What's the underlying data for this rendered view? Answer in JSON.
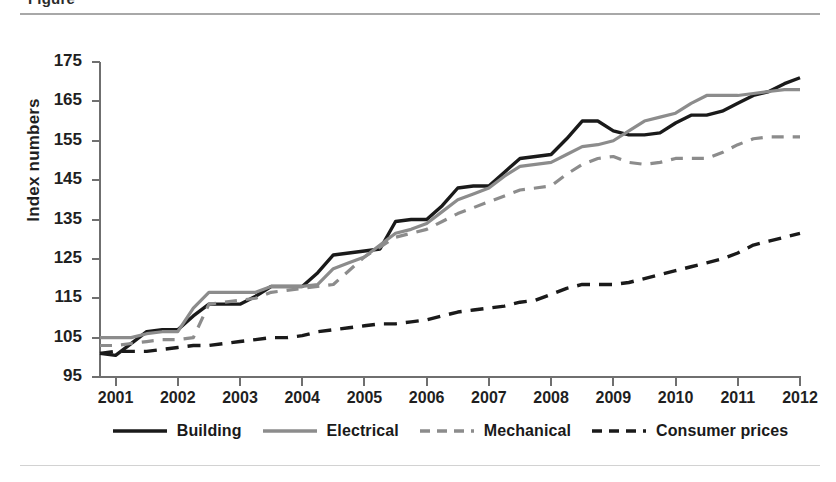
{
  "page": {
    "clipped_heading_fragment": "Figure",
    "divider_color": "#a8a8a8"
  },
  "axes": {
    "ylabel": "Index numbers",
    "yticks": [
      95,
      105,
      115,
      125,
      135,
      145,
      155,
      165,
      175
    ],
    "xticks": [
      "2001",
      "2002",
      "2003",
      "2004",
      "2005",
      "2006",
      "2007",
      "2008",
      "2009",
      "2010",
      "2011",
      "2012"
    ]
  },
  "legend": {
    "items": [
      {
        "label": "Building",
        "color": "#1a1a1a",
        "dash": "none"
      },
      {
        "label": "Electrical",
        "color": "#8c8c8c",
        "dash": "none"
      },
      {
        "label": "Mechanical",
        "color": "#8c8c8c",
        "dash": "dashed"
      },
      {
        "label": "Consumer prices",
        "color": "#1a1a1a",
        "dash": "dashed"
      }
    ]
  },
  "chart_data": {
    "type": "line",
    "title": "",
    "xlabel": "",
    "ylabel": "Index numbers",
    "xlim": [
      2000.75,
      2012.0
    ],
    "ylim": [
      95,
      175
    ],
    "ytick_step": 10,
    "grid": false,
    "legend_position": "bottom",
    "x": [
      2000.75,
      2001.0,
      2001.25,
      2001.5,
      2001.75,
      2002.0,
      2002.25,
      2002.5,
      2002.75,
      2003.0,
      2003.25,
      2003.5,
      2003.75,
      2004.0,
      2004.25,
      2004.5,
      2004.75,
      2005.0,
      2005.25,
      2005.5,
      2005.75,
      2006.0,
      2006.25,
      2006.5,
      2006.75,
      2007.0,
      2007.25,
      2007.5,
      2007.75,
      2008.0,
      2008.25,
      2008.5,
      2008.75,
      2009.0,
      2009.25,
      2009.5,
      2009.75,
      2010.0,
      2010.25,
      2010.5,
      2010.75,
      2011.0,
      2011.25,
      2011.5,
      2011.75,
      2012.0
    ],
    "series": [
      {
        "name": "Building",
        "color": "#1a1a1a",
        "dash": "none",
        "values": [
          101.0,
          100.5,
          103.5,
          106.5,
          107.0,
          107.0,
          110.5,
          113.5,
          113.5,
          113.5,
          115.5,
          118.0,
          118.0,
          118.0,
          121.5,
          126.0,
          126.5,
          127.0,
          127.5,
          134.5,
          135.0,
          135.0,
          138.5,
          143.0,
          143.5,
          143.5,
          147.0,
          150.5,
          151.0,
          151.5,
          155.5,
          160.0,
          160.0,
          157.5,
          156.5,
          156.5,
          157.0,
          159.5,
          161.5,
          161.5,
          162.5,
          164.5,
          166.5,
          167.5,
          169.5,
          171.0
        ]
      },
      {
        "name": "Electrical",
        "color": "#8c8c8c",
        "dash": "none",
        "values": [
          105.0,
          105.0,
          105.0,
          106.0,
          106.5,
          106.5,
          112.5,
          116.5,
          116.5,
          116.5,
          116.5,
          118.0,
          118.0,
          118.0,
          118.5,
          122.5,
          124.0,
          125.5,
          128.5,
          131.5,
          132.5,
          134.0,
          137.0,
          140.0,
          141.5,
          143.0,
          146.0,
          148.5,
          149.0,
          149.5,
          151.5,
          153.5,
          154.0,
          155.0,
          157.5,
          160.0,
          161.0,
          162.0,
          164.5,
          166.5,
          166.5,
          166.5,
          167.0,
          167.5,
          168.0,
          168.0
        ]
      },
      {
        "name": "Mechanical",
        "color": "#8c8c8c",
        "dash": "dashed",
        "values": [
          103.0,
          103.0,
          103.5,
          104.0,
          104.5,
          104.5,
          105.0,
          113.5,
          114.0,
          114.5,
          115.0,
          116.5,
          117.0,
          117.5,
          118.0,
          118.5,
          122.0,
          125.5,
          128.0,
          130.5,
          131.5,
          132.5,
          134.5,
          136.5,
          138.0,
          139.5,
          141.0,
          142.5,
          143.0,
          143.5,
          146.5,
          149.0,
          150.5,
          151.0,
          149.5,
          149.0,
          149.5,
          150.5,
          150.5,
          150.5,
          152.0,
          154.0,
          155.5,
          156.0,
          156.0,
          156.0
        ]
      },
      {
        "name": "Consumer prices",
        "color": "#1a1a1a",
        "dash": "dashed",
        "values": [
          101.0,
          101.5,
          101.5,
          101.5,
          102.0,
          102.5,
          103.0,
          103.0,
          103.5,
          104.0,
          104.5,
          105.0,
          105.0,
          105.5,
          106.5,
          107.0,
          107.5,
          108.0,
          108.5,
          108.5,
          109.0,
          109.5,
          110.5,
          111.5,
          112.0,
          112.5,
          113.0,
          114.0,
          114.5,
          116.0,
          117.5,
          118.5,
          118.5,
          118.5,
          119.0,
          120.0,
          121.0,
          122.0,
          123.0,
          124.0,
          125.0,
          126.5,
          128.5,
          129.5,
          130.5,
          131.5
        ]
      }
    ]
  }
}
